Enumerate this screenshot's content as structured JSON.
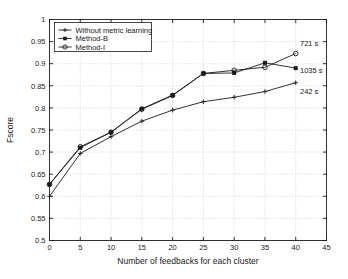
{
  "chart_data": {
    "type": "line",
    "title": "",
    "xlabel": "Number of feedbacks for each cluster",
    "ylabel": "Fscore",
    "x": [
      0,
      5,
      10,
      15,
      20,
      25,
      30,
      35,
      40
    ],
    "xlim": [
      0,
      45
    ],
    "ylim": [
      0.5,
      1
    ],
    "xticks": [
      "0",
      "5",
      "10",
      "15",
      "20",
      "25",
      "30",
      "35",
      "40",
      "45"
    ],
    "xtick_values": [
      0,
      5,
      10,
      15,
      20,
      25,
      30,
      35,
      40,
      45
    ],
    "yticks": [
      "0.5",
      "0.55",
      "0.6",
      "0.65",
      "0.7",
      "0.75",
      "0.8",
      "0.85",
      "0.9",
      "0.95",
      "1"
    ],
    "ytick_values": [
      0.5,
      0.55,
      0.6,
      0.65,
      0.7,
      0.75,
      0.8,
      0.85,
      0.9,
      0.95,
      1
    ],
    "grid": true,
    "grid_style": "dotted",
    "legend_position": "upper left",
    "series": [
      {
        "name": "Without metric learning",
        "marker": "plus",
        "color": "#1a1a1a",
        "values": [
          0.6,
          0.697,
          0.735,
          0.77,
          0.795,
          0.814,
          0.824,
          0.837,
          0.857
        ]
      },
      {
        "name": "Method-B",
        "marker": "filled-square",
        "color": "#1a1a1a",
        "values": [
          0.627,
          0.71,
          0.745,
          0.798,
          0.829,
          0.878,
          0.879,
          0.902,
          0.89
        ]
      },
      {
        "name": "Method-I",
        "marker": "open-circle",
        "color": "#1a1a1a",
        "values": [
          0.627,
          0.712,
          0.745,
          0.797,
          0.828,
          0.878,
          0.885,
          0.892,
          0.923
        ]
      }
    ],
    "annotations": [
      {
        "text": "721 s",
        "series": "Method-I",
        "x": 40,
        "y": 0.923
      },
      {
        "text": "1035 s",
        "series": "Method-B",
        "x": 40,
        "y": 0.89
      },
      {
        "text": "242 s",
        "series": "Without metric learning",
        "x": 40,
        "y": 0.857
      }
    ]
  },
  "legend": {
    "items": [
      {
        "label": "Without metric learning"
      },
      {
        "label": "Method-B"
      },
      {
        "label": "Method-I"
      }
    ]
  },
  "colors": {
    "axis": "#1a1a1a",
    "grid": "#b4b4b4",
    "background": "#ffffff"
  }
}
